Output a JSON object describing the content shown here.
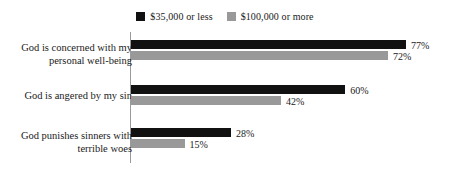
{
  "chart_data": {
    "type": "bar",
    "orientation": "horizontal",
    "title": "",
    "subtitle": "",
    "xlabel": "",
    "ylabel": "",
    "xlim": [
      0,
      100
    ],
    "grid": false,
    "legend_position": "top-center",
    "value_suffix": "%",
    "categories": [
      "God is concerned with my personal well-being",
      "God is angered by my sin",
      "God punishes sinners with terrible woes"
    ],
    "category_lines": [
      [
        "God is concerned with my",
        "personal well-being"
      ],
      [
        "God is angered by my sin"
      ],
      [
        "God punishes sinners with",
        "terrible woes"
      ]
    ],
    "series": [
      {
        "name": "$35,000 or less",
        "color": "#111111",
        "values": [
          77,
          60,
          28
        ],
        "value_labels": [
          "77%",
          "60%",
          "28%"
        ]
      },
      {
        "name": "$100,000 or more",
        "color": "#999999",
        "values": [
          72,
          42,
          15
        ],
        "value_labels": [
          "72%",
          "42%",
          "15%"
        ]
      }
    ],
    "colors": {
      "series_low_income": "#111111",
      "series_high_income": "#999999",
      "axis": "#9a9a9a",
      "text": "#1a1a1a",
      "background": "#ffffff"
    }
  },
  "legend": {
    "items": [
      {
        "label": "$35,000 or less",
        "color": "#111111"
      },
      {
        "label": "$100,000 or more",
        "color": "#999999"
      }
    ]
  }
}
